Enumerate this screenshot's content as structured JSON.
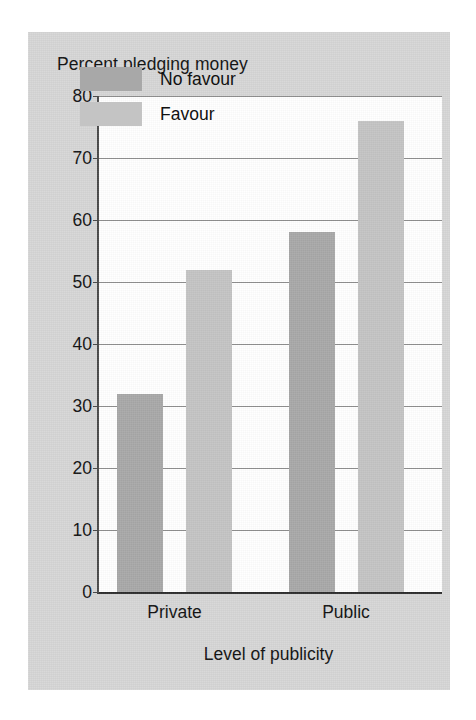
{
  "chart_data": {
    "type": "bar",
    "title": "Percent pledging money",
    "xlabel": "Level of publicity",
    "ylabel": "",
    "categories": [
      "Private",
      "Public"
    ],
    "series": [
      {
        "name": "No favour",
        "values": [
          32,
          58
        ],
        "color": "#a8a8a8"
      },
      {
        "name": "Favour",
        "values": [
          52,
          76
        ],
        "color": "#c4c4c4"
      }
    ],
    "ylim": [
      0,
      80
    ],
    "yticks": [
      0,
      10,
      20,
      30,
      40,
      50,
      60,
      70,
      80
    ],
    "ytick_labels": [
      "0",
      "10",
      "20",
      "30",
      "40",
      "50",
      "60",
      "70",
      "80"
    ],
    "grid": true,
    "legend_position": "upper left",
    "plot_background": "#ffffff",
    "figure_background": "#d6d6d6"
  }
}
